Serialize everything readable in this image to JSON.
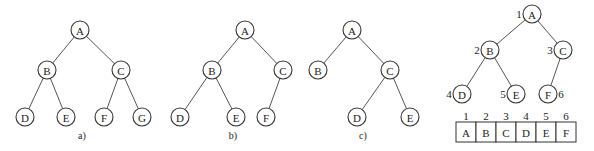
{
  "radius": 9,
  "trees": [
    {
      "id": "a",
      "label": "a)",
      "label_pos": [
        82,
        139
      ],
      "nodes": [
        {
          "id": "A",
          "x": 80,
          "y": 30
        },
        {
          "id": "B",
          "x": 47,
          "y": 70
        },
        {
          "id": "C",
          "x": 121,
          "y": 70
        },
        {
          "id": "D",
          "x": 25,
          "y": 117
        },
        {
          "id": "E",
          "x": 66,
          "y": 117
        },
        {
          "id": "F",
          "x": 104,
          "y": 117
        },
        {
          "id": "G",
          "x": 142,
          "y": 117
        }
      ],
      "edges": [
        [
          "A",
          "B"
        ],
        [
          "A",
          "C"
        ],
        [
          "B",
          "D"
        ],
        [
          "B",
          "E"
        ],
        [
          "C",
          "F"
        ],
        [
          "C",
          "G"
        ]
      ]
    },
    {
      "id": "b",
      "label": "b)",
      "label_pos": [
        233,
        139
      ],
      "nodes": [
        {
          "id": "A",
          "x": 245,
          "y": 30
        },
        {
          "id": "B",
          "x": 212,
          "y": 70
        },
        {
          "id": "C",
          "x": 283,
          "y": 70
        },
        {
          "id": "D",
          "x": 180,
          "y": 117
        },
        {
          "id": "E",
          "x": 236,
          "y": 117
        },
        {
          "id": "F",
          "x": 266,
          "y": 117
        }
      ],
      "edges": [
        [
          "A",
          "B"
        ],
        [
          "A",
          "C"
        ],
        [
          "B",
          "D"
        ],
        [
          "B",
          "E"
        ],
        [
          "C",
          "F"
        ]
      ]
    },
    {
      "id": "c",
      "label": "c)",
      "label_pos": [
        363,
        139
      ],
      "nodes": [
        {
          "id": "A",
          "x": 352,
          "y": 30
        },
        {
          "id": "B",
          "x": 318,
          "y": 70
        },
        {
          "id": "C",
          "x": 390,
          "y": 70
        },
        {
          "id": "D",
          "x": 357,
          "y": 117
        },
        {
          "id": "E",
          "x": 410,
          "y": 117
        }
      ],
      "edges": [
        [
          "A",
          "B"
        ],
        [
          "A",
          "C"
        ],
        [
          "C",
          "D"
        ],
        [
          "C",
          "E"
        ]
      ]
    },
    {
      "id": "d",
      "label": "",
      "nodes": [
        {
          "id": "A",
          "x": 532,
          "y": 14,
          "num": "1",
          "num_dx": -13
        },
        {
          "id": "B",
          "x": 490,
          "y": 50,
          "num": "2",
          "num_dx": -13
        },
        {
          "id": "C",
          "x": 563,
          "y": 50,
          "num": "3",
          "num_dx": -13
        },
        {
          "id": "D",
          "x": 462,
          "y": 94,
          "num": "4",
          "num_dx": -13
        },
        {
          "id": "E",
          "x": 516,
          "y": 94,
          "num": "5",
          "num_dx": -13
        },
        {
          "id": "F",
          "x": 548,
          "y": 94,
          "num": "6",
          "num_dx": 13
        }
      ],
      "edges": [
        [
          "A",
          "B"
        ],
        [
          "A",
          "C"
        ],
        [
          "B",
          "D"
        ],
        [
          "B",
          "E"
        ],
        [
          "C",
          "F"
        ]
      ]
    }
  ],
  "array": {
    "x": 456,
    "y": 122,
    "cell_w": 20,
    "cell_h": 20,
    "index_y": 116,
    "indices": [
      "1",
      "2",
      "3",
      "4",
      "5",
      "6"
    ],
    "values": [
      "A",
      "B",
      "C",
      "D",
      "E",
      "F"
    ]
  }
}
